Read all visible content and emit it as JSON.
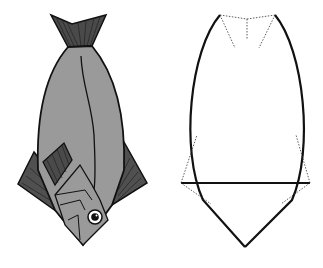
{
  "figure": {
    "panels": [
      {
        "id": "fish-illustration",
        "description": "Folded origami fish, gray body, dark fins and tail, head pointing down"
      },
      {
        "id": "crease-diagram",
        "description": "Line diagram of fish outline: two crossing arcs forming a lens shape, dotted tail triangles at top, horizontal line with dotted side triangles near bottom"
      }
    ]
  },
  "colors": {
    "body": "#9a9a9a",
    "fin": "#505050",
    "outline": "#111111",
    "background": "#ffffff"
  }
}
